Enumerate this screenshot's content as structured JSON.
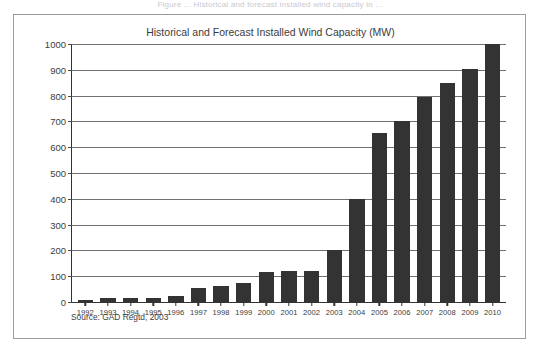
{
  "top_caption": "Figure ... Historical and forecast installed wind capacity in ...",
  "figure": {
    "title": "Historical and Forecast Installed Wind Capacity (MW)",
    "source_note": "Source: GAD Regtd, 2003"
  },
  "colors": {
    "bar": "#333333",
    "axis": "#333333",
    "gridline": "#6f6f74",
    "frame": "#9a9aa0",
    "text": "#3c3c3c",
    "background": "#ffffff"
  },
  "chart_data": {
    "type": "bar",
    "title": "Historical and Forecast Installed Wind Capacity (MW)",
    "xlabel": "",
    "ylabel": "",
    "ylim": [
      0,
      1000
    ],
    "yticks": [
      0,
      100,
      200,
      300,
      400,
      500,
      600,
      700,
      800,
      900,
      1000
    ],
    "ytick_labels": [
      "0",
      "100",
      "200",
      "300",
      "400",
      "500",
      "600",
      "700",
      "800",
      "900",
      "1000"
    ],
    "grid": true,
    "legend": false,
    "units": "MW",
    "source": "Source: GAD Regtd, 2003",
    "categories": [
      "1992",
      "1993",
      "1994",
      "1995",
      "1996",
      "1997",
      "1998",
      "1999",
      "2000",
      "2001",
      "2002",
      "2003",
      "2004",
      "2005",
      "2006",
      "2007",
      "2008",
      "2009",
      "2010"
    ],
    "values": [
      8,
      16,
      16,
      15,
      22,
      55,
      62,
      75,
      118,
      120,
      122,
      200,
      400,
      655,
      700,
      795,
      850,
      905,
      1000
    ]
  }
}
